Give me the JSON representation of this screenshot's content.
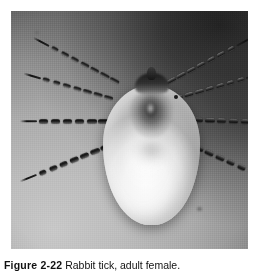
{
  "figure": {
    "label": "Figure 2-22",
    "caption_text": "Rabbit tick, adult female.",
    "media_type": "black-and-white photograph"
  },
  "photo": {
    "alt_name": "tick-photograph",
    "background_description": "mottled gray field, bright at lower left, deep shadow at upper right",
    "colors": {
      "background_light": "#c8c8c8",
      "background_mid": "#9d9d9d",
      "background_shadow": "#3a3a3a",
      "body_pale": "#f7f7f7",
      "body_edge": "#b2b2b2",
      "leg_dark": "#141414",
      "scutum_dark": "#3a3a3a"
    },
    "anatomy": {
      "body_label": "idiosoma",
      "scutum_label": "scutum",
      "capitulum_label": "capitulum",
      "hypostome_label": "hypostome",
      "leg_count": 8
    },
    "legs": [
      {
        "name": "leg-left-1",
        "x": 108,
        "y": 70,
        "angle": 208,
        "length": 96,
        "segments": 7,
        "width": "thin"
      },
      {
        "name": "leg-left-2",
        "x": 102,
        "y": 86,
        "angle": 196,
        "length": 92,
        "segments": 7,
        "width": "thin"
      },
      {
        "name": "leg-left-3",
        "x": 98,
        "y": 108,
        "angle": 180,
        "length": 88,
        "segments": 6,
        "width": "thick"
      },
      {
        "name": "leg-left-4",
        "x": 99,
        "y": 132,
        "angle": 158,
        "length": 96,
        "segments": 7,
        "width": "thick"
      },
      {
        "name": "leg-right-1",
        "x": 156,
        "y": 70,
        "angle": 332,
        "length": 96,
        "segments": 7,
        "width": "thin"
      },
      {
        "name": "leg-right-2",
        "x": 163,
        "y": 86,
        "angle": 344,
        "length": 92,
        "segments": 7,
        "width": "thin"
      },
      {
        "name": "leg-right-3",
        "x": 170,
        "y": 106,
        "angle": 2,
        "length": 86,
        "segments": 6,
        "width": "thick"
      },
      {
        "name": "leg-right-4",
        "x": 172,
        "y": 128,
        "angle": 24,
        "length": 100,
        "segments": 7,
        "width": "thick"
      }
    ]
  }
}
